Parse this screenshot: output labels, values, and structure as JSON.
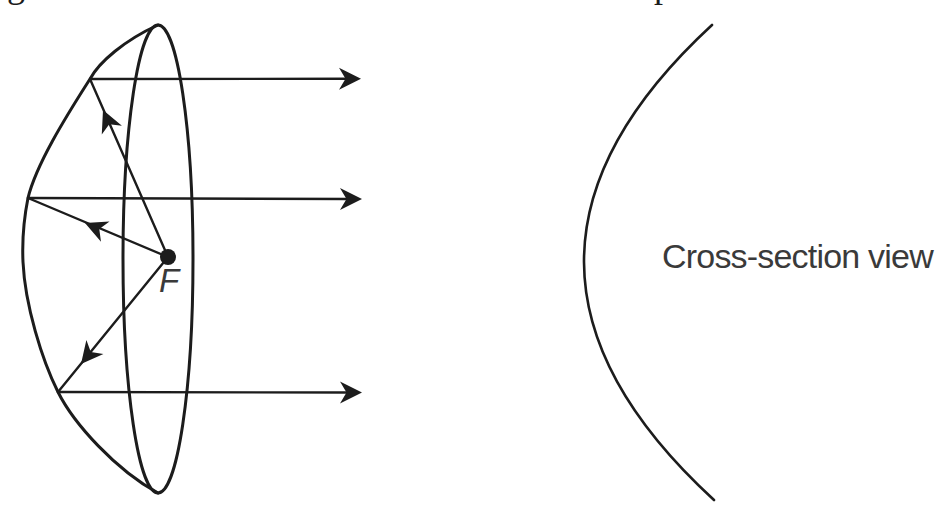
{
  "colors": {
    "background": "#ffffff",
    "ink": "#1c1c1c",
    "caption_text": "#3a3a3a"
  },
  "cropped_caption_fragments": {
    "left_glyph": "g",
    "right_glyph": "p"
  },
  "dish_figure": {
    "focal_point_label": "F",
    "elements": [
      "dish-rim-ellipse",
      "dish-silhouette",
      "focal-point-dot",
      "focal-rays-with-arrowheads",
      "reflected-parallel-rays"
    ]
  },
  "cross_section_figure": {
    "caption": "Cross-section view",
    "elements": [
      "parabolic-arc"
    ]
  }
}
